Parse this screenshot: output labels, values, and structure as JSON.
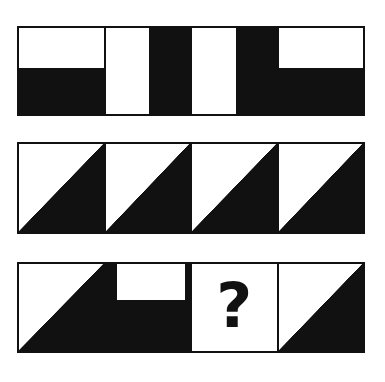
{
  "puzzle": {
    "title": "Matrix reasoning pattern puzzle",
    "question_mark": "?",
    "colors": {
      "ink": "#111111",
      "paper": "#ffffff"
    },
    "rows": [
      {
        "name": "row-1",
        "cells": [
          {
            "name": "row1-cell1",
            "shape": "bottom-half-black",
            "label": "white band over black lower half"
          },
          {
            "name": "row1-cell2",
            "shape": "left-white-bar",
            "label": "white vertical bar on left, black right"
          },
          {
            "name": "row1-cell3",
            "shape": "left-white-bar",
            "label": "white vertical bar on left, black right"
          },
          {
            "name": "row1-cell4",
            "shape": "bottom-half-black",
            "label": "white band over black lower half"
          }
        ]
      },
      {
        "name": "row-2",
        "cells": [
          {
            "name": "row2-cell1",
            "shape": "triangle-upper-right",
            "label": "black triangle upper right"
          },
          {
            "name": "row2-cell2",
            "shape": "triangle-upper-right",
            "label": "black triangle upper right"
          },
          {
            "name": "row2-cell3",
            "shape": "triangle-upper-right",
            "label": "black triangle upper right"
          },
          {
            "name": "row2-cell4",
            "shape": "triangle-upper-right",
            "label": "black triangle upper right"
          }
        ]
      },
      {
        "name": "row-3",
        "cells": [
          {
            "name": "row3-cell1",
            "shape": "triangle-upper-right",
            "label": "black triangle upper right"
          },
          {
            "name": "row3-cell2",
            "shape": "black-with-white-inset-rect",
            "label": "black field with white rectangle inset at top"
          },
          {
            "name": "row3-cell3",
            "shape": "question",
            "label": "missing tile marked with a question mark"
          },
          {
            "name": "row3-cell4",
            "shape": "triangle-upper-right",
            "label": "black triangle upper right"
          }
        ]
      }
    ]
  }
}
